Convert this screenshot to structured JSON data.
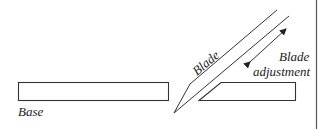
{
  "diagram": {
    "type": "schematic",
    "labels": {
      "base": "Base",
      "blade": "Blade",
      "adjustment_line1": "Blade",
      "adjustment_line2": "adjustment"
    },
    "colors": {
      "line": "#333333",
      "text": "#222222",
      "background": "#ffffff"
    },
    "elements": [
      {
        "name": "base",
        "shape": "rectangle"
      },
      {
        "name": "blade",
        "shape": "angled strip with pointed tip"
      },
      {
        "name": "blade-guide",
        "shape": "parallelogram"
      },
      {
        "name": "adjustment-arrow",
        "shape": "double-headed arrow"
      },
      {
        "name": "right-border",
        "shape": "vertical line"
      }
    ]
  }
}
